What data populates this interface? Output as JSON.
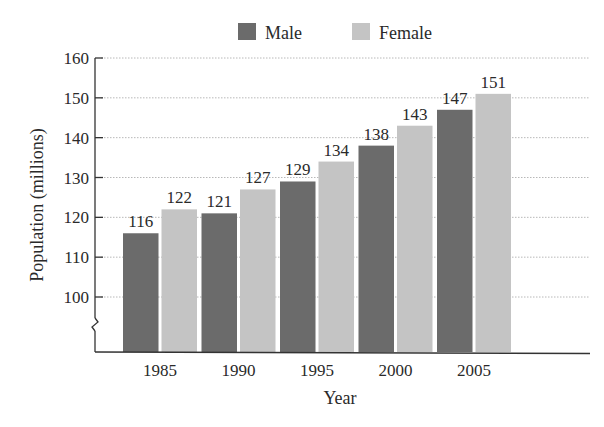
{
  "chart_data": {
    "type": "bar",
    "title": "",
    "xlabel": "Year",
    "ylabel": "Population (millions)",
    "categories": [
      "1985",
      "1990",
      "1995",
      "2000",
      "2005"
    ],
    "series": [
      {
        "name": "Male",
        "values": [
          116,
          121,
          129,
          138,
          147
        ],
        "color": "#6b6b6b"
      },
      {
        "name": "Female",
        "values": [
          122,
          127,
          134,
          143,
          151
        ],
        "color": "#c4c4c4"
      }
    ],
    "ylim": [
      100,
      160
    ],
    "yticks": [
      100,
      110,
      120,
      130,
      140,
      150,
      160
    ],
    "y_axis_break": true,
    "grid": {
      "horizontal": true,
      "style": "dotted"
    },
    "legend_position": "top-center",
    "data_labels": true
  },
  "legend": [
    {
      "label": "Male",
      "color": "#6b6b6b"
    },
    {
      "label": "Female",
      "color": "#c4c4c4"
    }
  ],
  "axes": {
    "x_title": "Year",
    "y_title": "Population (millions)"
  }
}
